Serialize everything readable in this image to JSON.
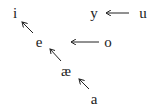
{
  "diagram": {
    "type": "vowel-shift",
    "nodes": [
      {
        "id": "i",
        "label": "i",
        "x": 15,
        "y": 13
      },
      {
        "id": "e",
        "label": "e",
        "x": 39,
        "y": 42
      },
      {
        "id": "ae",
        "label": "æ",
        "x": 66,
        "y": 71
      },
      {
        "id": "a",
        "label": "a",
        "x": 94,
        "y": 99
      },
      {
        "id": "y",
        "label": "y",
        "x": 94,
        "y": 13
      },
      {
        "id": "u",
        "label": "u",
        "x": 143,
        "y": 13
      },
      {
        "id": "o",
        "label": "o",
        "x": 108,
        "y": 42
      }
    ],
    "edges": [
      {
        "from": "e",
        "to": "i",
        "x1": 33,
        "y1": 33,
        "x2": 22,
        "y2": 22
      },
      {
        "from": "ae",
        "to": "e",
        "x1": 61,
        "y1": 61,
        "x2": 50,
        "y2": 49
      },
      {
        "from": "a",
        "to": "ae",
        "x1": 89,
        "y1": 89,
        "x2": 79,
        "y2": 79
      },
      {
        "from": "u",
        "to": "y",
        "x1": 129,
        "y1": 13,
        "x2": 106,
        "y2": 13
      },
      {
        "from": "o",
        "to": "empty",
        "x1": 99,
        "y1": 42,
        "x2": 71,
        "y2": 42
      }
    ],
    "colors": {
      "ink": "#222222",
      "background": "#ffffff"
    }
  }
}
